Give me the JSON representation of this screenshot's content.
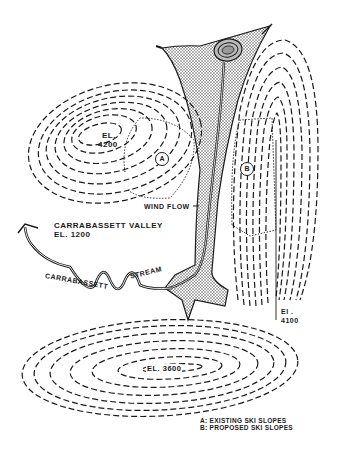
{
  "map": {
    "labels": {
      "peak_a_el": "EL.",
      "peak_a_val": "4200",
      "peak_b_el": "El .",
      "peak_b_val": "4100",
      "peak_c": "EL. 3600",
      "wind_flow": "WIND FLOW",
      "valley_name": "CARRABASSETT VALLEY",
      "valley_el": "EL. 1200",
      "stream_word1": "CARRABASSETT",
      "stream_word2": "STREAM"
    },
    "markers": {
      "a": "A",
      "b": "B"
    },
    "legend": {
      "a": "A: EXISTING SKI SLOPES",
      "b": "B: PROPOSED SKI SLOPES"
    },
    "colors": {
      "ink": "#1a1a1a",
      "stipple": "#9a9a9a",
      "background": "#ffffff"
    }
  }
}
